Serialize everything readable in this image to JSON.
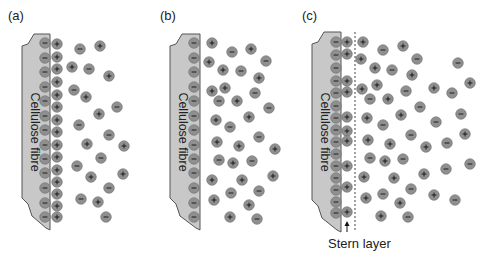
{
  "colors": {
    "fibre_fill": "#c8c8c8",
    "fibre_stroke": "#555555",
    "ion_fill": "#8f8f8f",
    "ion_stroke": "#6e6e6e",
    "sign": "#111111",
    "text": "#222222"
  },
  "panels": [
    {
      "label": "(a)",
      "fibre_label": "Cellulose fibre",
      "label_pos": [
        8,
        20
      ],
      "fibre": {
        "x_left": 22,
        "x_right": 50,
        "top": 34,
        "bottom": 230
      },
      "surface_neg": {
        "x": 45,
        "ys": [
          43,
          58,
          72,
          87,
          101,
          116,
          130,
          145,
          159,
          173,
          188,
          203,
          217
        ]
      },
      "surface_pos": {
        "x": 57,
        "ys": [
          44,
          57,
          69,
          82,
          95,
          107,
          120,
          132,
          145,
          157,
          170,
          182,
          194,
          206,
          217
        ]
      },
      "free_ions": [
        {
          "s": "-",
          "x": 80,
          "y": 49
        },
        {
          "s": "+",
          "x": 100,
          "y": 46
        },
        {
          "s": "+",
          "x": 72,
          "y": 67
        },
        {
          "s": "-",
          "x": 89,
          "y": 69
        },
        {
          "s": "+",
          "x": 109,
          "y": 76
        },
        {
          "s": "-",
          "x": 74,
          "y": 90
        },
        {
          "s": "+",
          "x": 86,
          "y": 97
        },
        {
          "s": "-",
          "x": 117,
          "y": 107
        },
        {
          "s": "+",
          "x": 99,
          "y": 114
        },
        {
          "s": "-",
          "x": 79,
          "y": 125
        },
        {
          "s": "-",
          "x": 109,
          "y": 135
        },
        {
          "s": "+",
          "x": 87,
          "y": 144
        },
        {
          "s": "+",
          "x": 124,
          "y": 146
        },
        {
          "s": "-",
          "x": 101,
          "y": 158
        },
        {
          "s": "-",
          "x": 77,
          "y": 166
        },
        {
          "s": "+",
          "x": 91,
          "y": 177
        },
        {
          "s": "+",
          "x": 123,
          "y": 174
        },
        {
          "s": "-",
          "x": 109,
          "y": 188
        },
        {
          "s": "-",
          "x": 81,
          "y": 199
        },
        {
          "s": "+",
          "x": 98,
          "y": 202
        },
        {
          "s": "-",
          "x": 106,
          "y": 217
        }
      ]
    },
    {
      "label": "(b)",
      "fibre_label": "Cellulose fibre",
      "label_pos": [
        160,
        20
      ],
      "fibre": {
        "x_left": 170,
        "x_right": 200,
        "top": 34,
        "bottom": 230
      },
      "surface_neg": {
        "x": 194,
        "ys": [
          43,
          58,
          72,
          87,
          101,
          116,
          130,
          145,
          159,
          173,
          188,
          203,
          217
        ]
      },
      "surface_pos": null,
      "free_ions": [
        {
          "s": "+",
          "x": 212,
          "y": 43
        },
        {
          "s": "-",
          "x": 232,
          "y": 52
        },
        {
          "s": "+",
          "x": 251,
          "y": 49
        },
        {
          "s": "+",
          "x": 209,
          "y": 62
        },
        {
          "s": "-",
          "x": 266,
          "y": 61
        },
        {
          "s": "+",
          "x": 223,
          "y": 70
        },
        {
          "s": "-",
          "x": 241,
          "y": 71
        },
        {
          "s": "+",
          "x": 259,
          "y": 78
        },
        {
          "s": "+",
          "x": 212,
          "y": 91
        },
        {
          "s": "+",
          "x": 225,
          "y": 88
        },
        {
          "s": "-",
          "x": 255,
          "y": 93
        },
        {
          "s": "-",
          "x": 219,
          "y": 101
        },
        {
          "s": "+",
          "x": 237,
          "y": 101
        },
        {
          "s": "-",
          "x": 269,
          "y": 108
        },
        {
          "s": "+",
          "x": 216,
          "y": 120
        },
        {
          "s": "+",
          "x": 249,
          "y": 117
        },
        {
          "s": "-",
          "x": 230,
          "y": 127
        },
        {
          "s": "-",
          "x": 259,
          "y": 137
        },
        {
          "s": "+",
          "x": 217,
          "y": 142
        },
        {
          "s": "+",
          "x": 239,
          "y": 146
        },
        {
          "s": "+",
          "x": 275,
          "y": 149
        },
        {
          "s": "-",
          "x": 219,
          "y": 160
        },
        {
          "s": "+",
          "x": 233,
          "y": 163
        },
        {
          "s": "-",
          "x": 252,
          "y": 161
        },
        {
          "s": "+",
          "x": 212,
          "y": 180
        },
        {
          "s": "+",
          "x": 242,
          "y": 180
        },
        {
          "s": "+",
          "x": 273,
          "y": 176
        },
        {
          "s": "-",
          "x": 231,
          "y": 193
        },
        {
          "s": "-",
          "x": 259,
          "y": 191
        },
        {
          "s": "+",
          "x": 214,
          "y": 200
        },
        {
          "s": "+",
          "x": 249,
          "y": 205
        },
        {
          "s": "+",
          "x": 230,
          "y": 217
        },
        {
          "s": "-",
          "x": 257,
          "y": 219
        }
      ]
    },
    {
      "label": "(c)",
      "fibre_label": "Cellulose fibre",
      "label_pos": [
        302,
        20
      ],
      "fibre": {
        "x_left": 312,
        "x_right": 341,
        "top": 32,
        "bottom": 232
      },
      "surface_neg": {
        "x": 336,
        "ys": [
          42,
          55,
          68,
          81,
          93,
          106,
          118,
          130,
          142,
          154,
          166,
          178,
          190,
          202,
          213
        ]
      },
      "surface_pos": {
        "x": 347,
        "ys": [
          42,
          54,
          81,
          92,
          117,
          131,
          141,
          166,
          187,
          212
        ]
      },
      "stern_line_x": 355,
      "stern_label": "Stern layer",
      "stern_label_pos": [
        328,
        248
      ],
      "stern_arrow": {
        "x": 347,
        "y_from": 232,
        "y_to": 221
      },
      "free_ions": [
        {
          "s": "+",
          "x": 363,
          "y": 42
        },
        {
          "s": "-",
          "x": 383,
          "y": 50
        },
        {
          "s": "+",
          "x": 403,
          "y": 46
        },
        {
          "s": "+",
          "x": 361,
          "y": 59
        },
        {
          "s": "-",
          "x": 417,
          "y": 59
        },
        {
          "s": "-",
          "x": 458,
          "y": 63
        },
        {
          "s": "+",
          "x": 375,
          "y": 68
        },
        {
          "s": "-",
          "x": 392,
          "y": 70
        },
        {
          "s": "+",
          "x": 412,
          "y": 75
        },
        {
          "s": "+",
          "x": 377,
          "y": 85
        },
        {
          "s": "+",
          "x": 362,
          "y": 89
        },
        {
          "s": "-",
          "x": 406,
          "y": 91
        },
        {
          "s": "+",
          "x": 434,
          "y": 88
        },
        {
          "s": "-",
          "x": 452,
          "y": 93
        },
        {
          "s": "+",
          "x": 470,
          "y": 83
        },
        {
          "s": "-",
          "x": 370,
          "y": 99
        },
        {
          "s": "+",
          "x": 388,
          "y": 99
        },
        {
          "s": "-",
          "x": 420,
          "y": 107
        },
        {
          "s": "-",
          "x": 461,
          "y": 114
        },
        {
          "s": "+",
          "x": 367,
          "y": 118
        },
        {
          "s": "+",
          "x": 401,
          "y": 115
        },
        {
          "s": "-",
          "x": 383,
          "y": 125
        },
        {
          "s": "-",
          "x": 436,
          "y": 122
        },
        {
          "s": "+",
          "x": 368,
          "y": 140
        },
        {
          "s": "+",
          "x": 390,
          "y": 144
        },
        {
          "s": "-",
          "x": 411,
          "y": 135
        },
        {
          "s": "+",
          "x": 426,
          "y": 147
        },
        {
          "s": "-",
          "x": 447,
          "y": 143
        },
        {
          "s": "+",
          "x": 465,
          "y": 134
        },
        {
          "s": "-",
          "x": 370,
          "y": 158
        },
        {
          "s": "+",
          "x": 385,
          "y": 161
        },
        {
          "s": "-",
          "x": 403,
          "y": 159
        },
        {
          "s": "+",
          "x": 424,
          "y": 174
        },
        {
          "s": "-",
          "x": 446,
          "y": 169
        },
        {
          "s": "-",
          "x": 470,
          "y": 164
        },
        {
          "s": "+",
          "x": 364,
          "y": 177
        },
        {
          "s": "+",
          "x": 394,
          "y": 178
        },
        {
          "s": "-",
          "x": 411,
          "y": 189
        },
        {
          "s": "+",
          "x": 366,
          "y": 198
        },
        {
          "s": "-",
          "x": 383,
          "y": 194
        },
        {
          "s": "+",
          "x": 400,
          "y": 203
        },
        {
          "s": "+",
          "x": 434,
          "y": 195
        },
        {
          "s": "-",
          "x": 455,
          "y": 200
        },
        {
          "s": "+",
          "x": 381,
          "y": 216
        },
        {
          "s": "-",
          "x": 408,
          "y": 217
        }
      ]
    }
  ]
}
